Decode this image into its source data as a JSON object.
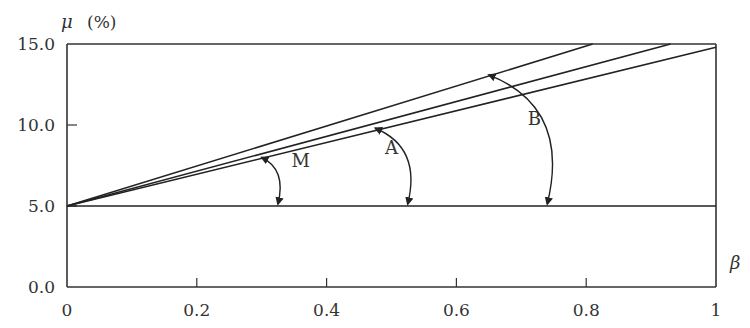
{
  "chart_data": {
    "type": "line",
    "title": "",
    "xlabel": "β",
    "ylabel": "μ",
    "ylabel_unit": "(%)",
    "xlim": [
      0,
      1
    ],
    "ylim": [
      0,
      15
    ],
    "grid": false,
    "x_ticks": [
      {
        "value": 0,
        "label": "0"
      },
      {
        "value": 0.2,
        "label": "0.2"
      },
      {
        "value": 0.4,
        "label": "0.4"
      },
      {
        "value": 0.6,
        "label": "0.6"
      },
      {
        "value": 0.8,
        "label": "0.8"
      },
      {
        "value": 1,
        "label": "1"
      }
    ],
    "y_ticks": [
      {
        "value": 0,
        "label": "0.0"
      },
      {
        "value": 5,
        "label": "5.0"
      },
      {
        "value": 10,
        "label": "10.0"
      },
      {
        "value": 15,
        "label": "15.0"
      }
    ],
    "series": [
      {
        "name": "baseline",
        "x": [
          0,
          1
        ],
        "y": [
          5.0,
          5.0
        ]
      },
      {
        "name": "line-1",
        "x": [
          0,
          0.81
        ],
        "y": [
          5.0,
          15.0
        ]
      },
      {
        "name": "line-2",
        "x": [
          0,
          0.93
        ],
        "y": [
          5.0,
          15.0
        ]
      },
      {
        "name": "line-3",
        "x": [
          0,
          1.0
        ],
        "y": [
          5.0,
          14.8
        ]
      }
    ],
    "annotations": [
      {
        "label": "M",
        "description": "angle arc between baseline and line group",
        "arc_from": [
          0.325,
          5.0
        ],
        "arc_to": [
          0.3,
          8.0
        ],
        "label_pos": [
          0.36,
          7.4
        ]
      },
      {
        "label": "A",
        "description": "angle arc between baseline and line-3",
        "arc_from": [
          0.525,
          5.0
        ],
        "arc_to": [
          0.475,
          9.8
        ],
        "label_pos": [
          0.5,
          8.2
        ]
      },
      {
        "label": "B",
        "description": "angle arc between baseline and line-1",
        "arc_from": [
          0.74,
          5.0
        ],
        "arc_to": [
          0.65,
          13.1
        ],
        "label_pos": [
          0.72,
          10.0
        ]
      }
    ]
  }
}
